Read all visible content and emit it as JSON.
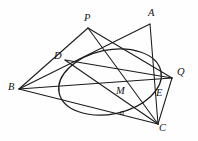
{
  "figure": {
    "width": 198,
    "height": 141,
    "background_color": "#fefefe",
    "ink_color": "#1a1a1a"
  },
  "labels": {
    "P": "P",
    "A": "A",
    "D": "D",
    "B": "B",
    "Q": "Q",
    "M": "M",
    "E": "E",
    "C": "C",
    "alpha": "a"
  },
  "points": [
    {
      "name": "P",
      "label": "P",
      "x": 88,
      "y": 28,
      "label_x": 84,
      "label_y": 13
    },
    {
      "name": "A",
      "label": "A",
      "x": 150,
      "y": 24,
      "label_x": 148,
      "label_y": 8
    },
    {
      "name": "D",
      "label": "D",
      "x": 65,
      "y": 60,
      "label_x": 54,
      "label_y": 51
    },
    {
      "name": "B",
      "label": "B",
      "x": 19,
      "y": 89,
      "label_x": 8,
      "label_y": 82
    },
    {
      "name": "Q",
      "label": "Q",
      "x": 172,
      "y": 78,
      "label_x": 177,
      "label_y": 67
    },
    {
      "name": "M",
      "label": "M",
      "x": 125,
      "y": 89,
      "label_x": 116,
      "label_y": 86
    },
    {
      "name": "E",
      "label": "E",
      "x": 155,
      "y": 92,
      "label_x": 156,
      "label_y": 88
    },
    {
      "name": "C",
      "label": "C",
      "x": 158,
      "y": 124,
      "label_x": 159,
      "label_y": 123
    },
    {
      "name": "alpha",
      "label": "a",
      "x": 124,
      "y": 113,
      "label_x": 120,
      "label_y": 108
    }
  ],
  "conic": {
    "type": "ellipse",
    "center_x": 110,
    "center_y": 82,
    "radius_x": 52,
    "radius_y": 32,
    "rotation_deg": -12
  },
  "segments": [
    {
      "name": "segment-P-B",
      "from": "P",
      "to": "B"
    },
    {
      "name": "segment-P-Q",
      "from": "P",
      "to": "Q"
    },
    {
      "name": "segment-P-C",
      "from": "P",
      "to": "C"
    },
    {
      "name": "segment-A-B",
      "from": "A",
      "to": "B"
    },
    {
      "name": "segment-A-C",
      "from": "A",
      "to": "C"
    },
    {
      "name": "segment-B-Q",
      "from": "B",
      "to": "Q"
    },
    {
      "name": "segment-B-C",
      "from": "B",
      "to": "C"
    },
    {
      "name": "segment-D-Q",
      "from": "D",
      "to": "Q"
    },
    {
      "name": "segment-D-C",
      "from": "D",
      "to": "C"
    },
    {
      "name": "segment-Q-C",
      "from": "Q",
      "to": "C"
    }
  ]
}
